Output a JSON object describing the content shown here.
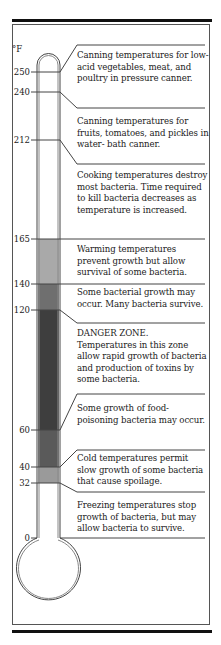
{
  "unit": "°F",
  "colors": {
    "tube_outline": "#444444",
    "band_warming": "#a9a9a9",
    "band_some_growth": "#6f6f6f",
    "band_danger": "#3e3e3e",
    "band_food_poisoning": "#5a5a5a",
    "band_cold": "#9a9a9a",
    "frame": "#555555",
    "bar": "#111111"
  },
  "scale": [
    {
      "value": "250",
      "y": 72
    },
    {
      "value": "240",
      "y": 92
    },
    {
      "value": "212",
      "y": 140
    },
    {
      "value": "165",
      "y": 239
    },
    {
      "value": "140",
      "y": 284
    },
    {
      "value": "120",
      "y": 310
    },
    {
      "value": "60",
      "y": 430
    },
    {
      "value": "40",
      "y": 467
    },
    {
      "value": "32",
      "y": 483
    },
    {
      "value": "0",
      "y": 538
    }
  ],
  "notes": [
    {
      "id": "pressure-canner",
      "text": "Canning temperatures for low-acid vegetables, meat, and poultry in pressure canner."
    },
    {
      "id": "water-bath",
      "text": "Canning temperatures for fruits, tomatoes, and pickles in water- bath canner."
    },
    {
      "id": "cooking",
      "text": "Cooking temperatures destroy most bacteria. Time required to kill bacteria decreases as temperature is increased."
    },
    {
      "id": "warming",
      "text": "Warming temperatures prevent growth but allow survival of some bacteria."
    },
    {
      "id": "some-growth",
      "text": "Some bacterial growth may occur. Many bacteria survive."
    },
    {
      "id": "danger-zone",
      "text": "DANGER ZONE. Temperatures in this zone allow rapid growth of bacteria and production of toxins by some bacteria."
    },
    {
      "id": "food-poisoning",
      "text": "Some growth of food-poisoning bacteria may occur."
    },
    {
      "id": "cold",
      "text": "Cold temperatures permit slow growth of some bacteria that cause spoilage."
    },
    {
      "id": "freezing",
      "text": "Freezing temperatures stop growth of bacteria, but may allow bacteria to survive."
    }
  ]
}
